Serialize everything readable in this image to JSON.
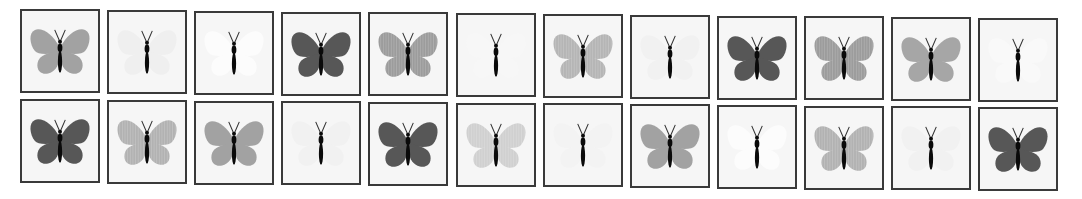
{
  "layout": {
    "columns": 12,
    "rows": 2
  },
  "colors": {
    "tile_border": "#3a3a3a",
    "tile_background": "#f6f6f6",
    "body": "#0a0a0a",
    "stripe": "#ffffff"
  },
  "rows": [
    {
      "name": "top-row",
      "tiles": [
        {
          "wing": "#a2a2a2",
          "striped": false,
          "shade": "medium"
        },
        {
          "wing": "#efefef",
          "striped": false,
          "shade": "faint"
        },
        {
          "wing": "#fcfcfc",
          "striped": false,
          "shade": "white"
        },
        {
          "wing": "#575757",
          "striped": false,
          "shade": "dark"
        },
        {
          "wing": "#9c9c9c",
          "striped": true,
          "shade": "medium-striped"
        },
        {
          "wing": "#f7f7f7",
          "striped": false,
          "shade": "white"
        },
        {
          "wing": "#b5b5b5",
          "striped": true,
          "shade": "light-striped"
        },
        {
          "wing": "#f1f1f1",
          "striped": false,
          "shade": "faint"
        },
        {
          "wing": "#575757",
          "striped": false,
          "shade": "dark"
        },
        {
          "wing": "#9c9c9c",
          "striped": true,
          "shade": "medium-striped"
        },
        {
          "wing": "#a6a6a6",
          "striped": false,
          "shade": "medium"
        },
        {
          "wing": "#f9f9f9",
          "striped": false,
          "shade": "white"
        }
      ]
    },
    {
      "name": "bottom-row",
      "tiles": [
        {
          "wing": "#575757",
          "striped": false,
          "shade": "dark"
        },
        {
          "wing": "#b2b2b2",
          "striped": true,
          "shade": "light-striped"
        },
        {
          "wing": "#a2a2a2",
          "striped": false,
          "shade": "medium"
        },
        {
          "wing": "#f1f1f1",
          "striped": false,
          "shade": "faint"
        },
        {
          "wing": "#575757",
          "striped": false,
          "shade": "dark"
        },
        {
          "wing": "#d0d0d0",
          "striped": true,
          "shade": "very-light-striped"
        },
        {
          "wing": "#f3f3f3",
          "striped": false,
          "shade": "faint"
        },
        {
          "wing": "#a2a2a2",
          "striped": false,
          "shade": "medium"
        },
        {
          "wing": "#fcfcfc",
          "striped": false,
          "shade": "white"
        },
        {
          "wing": "#b2b2b2",
          "striped": true,
          "shade": "light-striped"
        },
        {
          "wing": "#f1f1f1",
          "striped": false,
          "shade": "faint"
        },
        {
          "wing": "#575757",
          "striped": false,
          "shade": "dark"
        }
      ]
    }
  ]
}
